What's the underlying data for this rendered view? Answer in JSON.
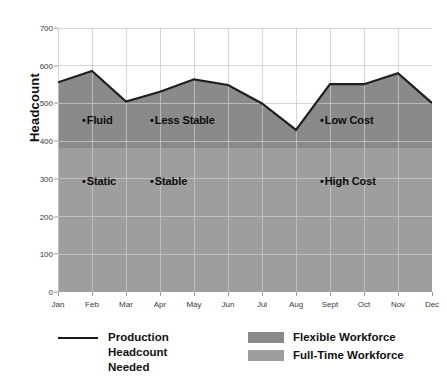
{
  "chart_data": {
    "type": "area",
    "title": "",
    "xlabel": "",
    "ylabel": "Headcount",
    "ylim": [
      0,
      700
    ],
    "yticks": [
      0,
      100,
      200,
      300,
      400,
      500,
      600,
      700
    ],
    "categories": [
      "Jan",
      "Feb",
      "Mar",
      "Apr",
      "May",
      "Jun",
      "Jul",
      "Aug",
      "Sept",
      "Oct",
      "Nov",
      "Dec"
    ],
    "grid": true,
    "legend_position": "below",
    "series": [
      {
        "name": "Production Headcount Needed",
        "type": "line",
        "values": [
          556,
          586,
          505,
          531,
          564,
          549,
          500,
          430,
          551,
          551,
          580,
          501
        ]
      },
      {
        "name": "Full-Time Workforce",
        "type": "band",
        "constant_value": 382,
        "range": [
          0,
          382
        ]
      },
      {
        "name": "Flexible Workforce",
        "type": "band",
        "description": "Area between the full-time workforce level and the production headcount needed line"
      }
    ],
    "annotations": [
      {
        "text": "Fluid",
        "marker": "•",
        "x_category": "Feb",
        "y_value": 455
      },
      {
        "text": "Less Stable",
        "marker": "•",
        "x_category": "Apr",
        "y_value": 455
      },
      {
        "text": "Low Cost",
        "marker": "•",
        "x_category": "Sept",
        "y_value": 455
      },
      {
        "text": "Static",
        "marker": "•",
        "x_category": "Feb",
        "y_value": 293
      },
      {
        "text": "Stable",
        "marker": "•",
        "x_category": "Apr",
        "y_value": 293
      },
      {
        "text": "High Cost",
        "marker": "•",
        "x_category": "Sept",
        "y_value": 293
      }
    ]
  },
  "axis": {
    "y_title": "Headcount",
    "y_tick_labels": [
      "700",
      "600",
      "500",
      "400",
      "300",
      "200",
      "100",
      "0"
    ],
    "x_tick_labels": [
      "Jan",
      "Feb",
      "Mar",
      "Apr",
      "May",
      "Jun",
      "Jul",
      "Aug",
      "Sept",
      "Oct",
      "Nov",
      "Dec"
    ]
  },
  "annotations": {
    "marker": "•",
    "items": [
      {
        "label": "Fluid"
      },
      {
        "label": "Less Stable"
      },
      {
        "label": "Low Cost"
      },
      {
        "label": "Static"
      },
      {
        "label": "Stable"
      },
      {
        "label": "High Cost"
      }
    ]
  },
  "legend": {
    "line_label": "Production\nHeadcount\nNeeded",
    "line_label_l1": "Production",
    "line_label_l2": "Headcount",
    "line_label_l3": "Needed",
    "flexible_label": "Flexible Workforce",
    "fulltime_label": "Full-Time Workforce"
  },
  "colors": {
    "flexible": "#8a8a8a",
    "fulltime": "#9e9e9e",
    "line": "#1f1f1f",
    "grid": "#c9c9c9",
    "plot_background": "#ffffff",
    "text": "#111111"
  }
}
